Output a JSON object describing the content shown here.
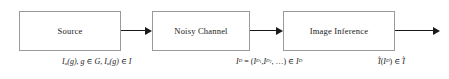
{
  "diagram": {
    "type": "block-flow-diagram",
    "stages": [
      {
        "id": "source",
        "label": "Source"
      },
      {
        "id": "channel",
        "label": "Noisy Channel"
      },
      {
        "id": "inference",
        "label": "Image Inference"
      }
    ],
    "arrows": [
      {
        "id": "source-to-channel",
        "direction": "right"
      },
      {
        "id": "channel-to-inference",
        "direction": "right"
      },
      {
        "id": "inference-to-output",
        "direction": "right"
      }
    ],
    "annotations": {
      "source": {
        "plain": "I_a(g), g ∈ G, I_a(g) ∈ I",
        "parts": {
          "image_symbol": "I",
          "alpha_subscript": "α",
          "arg": "(g)",
          "comma": ",",
          "g": "g",
          "in": "∈",
          "script_g": "G",
          "script_i": "I"
        }
      },
      "channel": {
        "plain": "I^D = (I^{D_1}, I^{D_2}, …) ∈ I^D",
        "parts": {
          "lhs": "I",
          "lhs_sup": "D",
          "equals": "=",
          "open": "(",
          "term1": "I",
          "term1_sup": "D",
          "term1_subsup": "1",
          "term2": "I",
          "term2_sup": "D",
          "term2_subsup": "2",
          "ellipsis": ", …)",
          "in": "∈",
          "script_i": "I",
          "script_i_sup": "D"
        }
      },
      "inference": {
        "plain": "Î(I^D) ∈ Î",
        "parts": {
          "ihat": "I",
          "hat_mark": "^",
          "open": "(",
          "arg": "I",
          "arg_sup": "D",
          "close": ")",
          "in": "∈",
          "script_i_hat": "I"
        }
      }
    },
    "colors": {
      "box_border": "#9a9a9a",
      "ink": "#1a1a1a",
      "background": "#ffffff"
    }
  }
}
